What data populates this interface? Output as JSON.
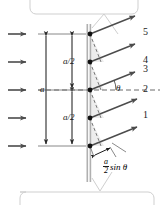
{
  "figure": {
    "title_alt": "Single-slit diffraction: wavefront split into halves",
    "colors": {
      "ink": "#1b1b1b",
      "ray": "#4c4c4c",
      "barrier": "#b0b0b0",
      "shade": "#ededed",
      "dash": "#6b6b6b",
      "callout_box": "#cfcfcf"
    },
    "barrier": {
      "name": "slit-barrier"
    },
    "incoming_arrows": {
      "count": 5,
      "label": "incident-plane-wave"
    },
    "slit_points": {
      "count": 5,
      "label": "huygens-source-point"
    },
    "rays": [
      {
        "id": "ray-5",
        "number": "5"
      },
      {
        "id": "ray-4",
        "number": "4"
      },
      {
        "id": "ray-3",
        "number": "3"
      },
      {
        "id": "ray-2",
        "number": "2"
      },
      {
        "id": "ray-1",
        "number": "1"
      }
    ],
    "ray_numbers": [
      "5",
      "4",
      "3",
      "2",
      "1"
    ],
    "dimensions": {
      "full_width": "a",
      "half_upper": "a/2",
      "half_lower": "a/2"
    },
    "angle_label": "θ",
    "path_difference": {
      "numerator": "a",
      "denominator": "2",
      "trailing": "sin θ",
      "full": "(a/2) sin θ"
    },
    "callouts": {
      "top": "",
      "bottom": ""
    }
  }
}
